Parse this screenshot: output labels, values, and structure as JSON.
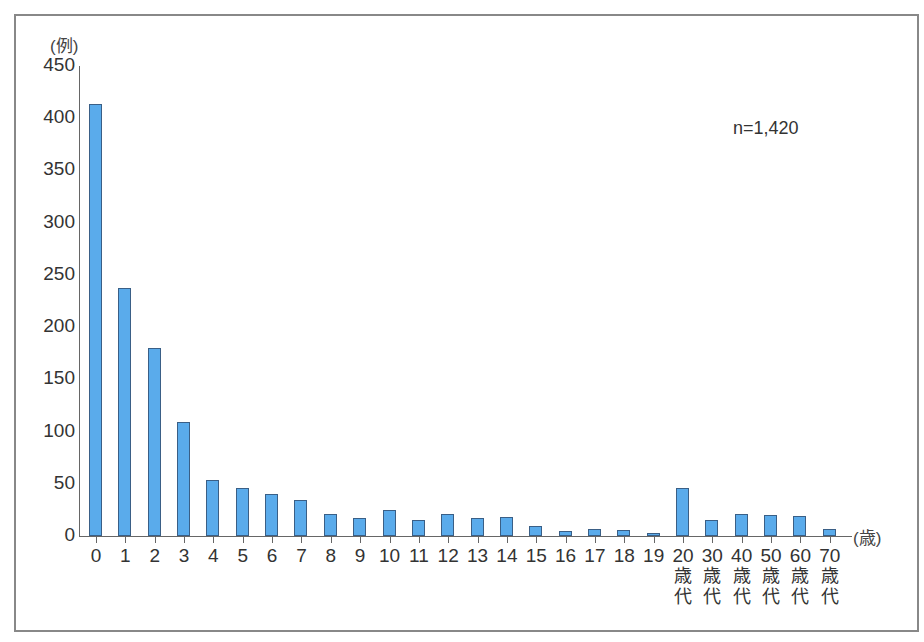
{
  "chart_data": {
    "type": "bar",
    "title": "",
    "ylabel": "(例)",
    "xlabel": "(歳)",
    "ylim": [
      0,
      450
    ],
    "yticks": [
      0,
      50,
      100,
      150,
      200,
      250,
      300,
      350,
      400,
      450
    ],
    "annotation": "n=1,420",
    "grid": false,
    "legend": null,
    "bar_color": "#5aabeb",
    "bar_edge_color": "#3a5f86",
    "categories": [
      "0",
      "1",
      "2",
      "3",
      "4",
      "5",
      "6",
      "7",
      "8",
      "9",
      "10",
      "11",
      "12",
      "13",
      "14",
      "15",
      "16",
      "17",
      "18",
      "19",
      "20歳代",
      "30歳代",
      "40歳代",
      "50歳代",
      "60歳代",
      "70歳代"
    ],
    "category_labels": [
      {
        "main": "0",
        "sub": ""
      },
      {
        "main": "1",
        "sub": ""
      },
      {
        "main": "2",
        "sub": ""
      },
      {
        "main": "3",
        "sub": ""
      },
      {
        "main": "4",
        "sub": ""
      },
      {
        "main": "5",
        "sub": ""
      },
      {
        "main": "6",
        "sub": ""
      },
      {
        "main": "7",
        "sub": ""
      },
      {
        "main": "8",
        "sub": ""
      },
      {
        "main": "9",
        "sub": ""
      },
      {
        "main": "10",
        "sub": ""
      },
      {
        "main": "11",
        "sub": ""
      },
      {
        "main": "12",
        "sub": ""
      },
      {
        "main": "13",
        "sub": ""
      },
      {
        "main": "14",
        "sub": ""
      },
      {
        "main": "15",
        "sub": ""
      },
      {
        "main": "16",
        "sub": ""
      },
      {
        "main": "17",
        "sub": ""
      },
      {
        "main": "18",
        "sub": ""
      },
      {
        "main": "19",
        "sub": ""
      },
      {
        "main": "20",
        "sub": "歳\n代"
      },
      {
        "main": "30",
        "sub": "歳\n代"
      },
      {
        "main": "40",
        "sub": "歳\n代"
      },
      {
        "main": "50",
        "sub": "歳\n代"
      },
      {
        "main": "60",
        "sub": "歳\n代"
      },
      {
        "main": "70",
        "sub": "歳\n代"
      }
    ],
    "values": [
      414,
      237,
      180,
      109,
      54,
      46,
      40,
      34,
      21,
      17,
      25,
      15,
      21,
      17,
      18,
      10,
      5,
      7,
      6,
      3,
      46,
      15,
      21,
      20,
      19,
      7
    ]
  }
}
